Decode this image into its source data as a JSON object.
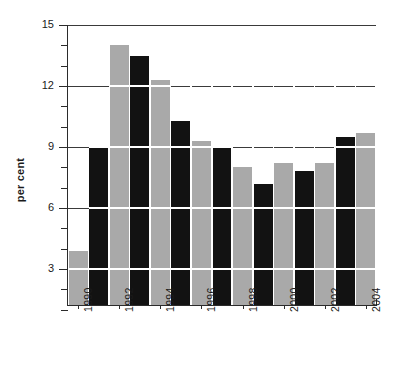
{
  "chart_data": {
    "type": "bar",
    "title": "",
    "subtitle": "",
    "xlabel": "",
    "ylabel": "per cent",
    "ylim": [
      0,
      15
    ],
    "ytick_labels": [
      "15",
      "12",
      "9",
      "6",
      "3"
    ],
    "ytick_values": [
      15,
      12,
      9,
      6,
      3
    ],
    "minor_tick_step": 1,
    "grid": "horizontal-major",
    "legend": "none",
    "legend_position": "none",
    "categories": [
      "1990",
      "1991",
      "1992",
      "1993",
      "1994",
      "1995",
      "1996",
      "1997",
      "1998",
      "1999",
      "2000",
      "2001",
      "2002",
      "2003",
      "2004"
    ],
    "xtick_labels_shown": [
      "1990",
      "1992",
      "1994",
      "1996",
      "1998",
      "2000",
      "2002",
      "2004"
    ],
    "values": [
      3.9,
      9.0,
      14.0,
      13.5,
      12.3,
      10.3,
      9.3,
      9.0,
      8.0,
      7.2,
      8.2,
      7.8,
      8.2,
      9.5,
      9.7
    ],
    "bar_colors": [
      "gray",
      "black",
      "gray",
      "black",
      "gray",
      "black",
      "gray",
      "black",
      "gray",
      "black",
      "gray",
      "black",
      "gray",
      "black",
      "gray"
    ],
    "colors": {
      "gray": "#a9a9a9",
      "black": "#121212",
      "axis": "#2b2b2b",
      "gridline": "#3a3a3a",
      "separator": "#ffffff",
      "background": "#ffffff",
      "text": "#1a1a1a"
    }
  }
}
